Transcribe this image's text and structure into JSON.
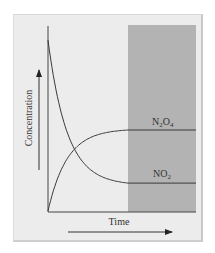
{
  "chart_data": {
    "type": "line",
    "title": "",
    "xlabel": "Time",
    "ylabel": "Concentration",
    "xlim": [
      0,
      10
    ],
    "ylim": [
      0,
      10
    ],
    "grid": false,
    "legend": "inline labels at right",
    "equilibrium_region": {
      "x_start": 5.4,
      "x_end": 10,
      "color": "#b3b3b3",
      "note": "shaded region where concentrations are constant (equilibrium)"
    },
    "series": [
      {
        "name": "N2O4",
        "label": "N₂O₄",
        "x": [
          0,
          1,
          2,
          3,
          4,
          5.4,
          10
        ],
        "values": [
          0,
          2.1,
          3.2,
          3.85,
          4.2,
          4.38,
          4.38
        ]
      },
      {
        "name": "NO2",
        "label": "NO₂",
        "x": [
          0,
          1,
          2,
          3,
          4,
          5.4,
          10
        ],
        "values": [
          9.24,
          5.6,
          3.6,
          2.5,
          1.9,
          1.51,
          1.51
        ]
      }
    ],
    "annotations": [
      "Upward arrow beside Concentration axis label",
      "Rightward arrow beneath Time axis label"
    ]
  },
  "labels": {
    "x_axis": "Time",
    "y_axis": "Concentration",
    "series_n2o4": "N₂O₄",
    "series_no2": "NO₂"
  },
  "colors": {
    "background": "#ececec",
    "equilibrium_shade": "#b3b3b3",
    "line": "#3a3a3a"
  }
}
